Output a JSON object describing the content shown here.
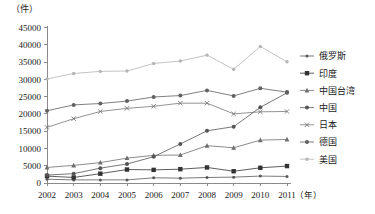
{
  "chart_data": {
    "type": "line",
    "title": "",
    "subtitle": "",
    "unit_label": "（件）",
    "xlabel": "（年）",
    "ylabel": "",
    "grid": false,
    "legend_position": "right",
    "categories": [
      "2002",
      "2003",
      "2004",
      "2005",
      "2006",
      "2007",
      "2008",
      "2009",
      "2010",
      "2011"
    ],
    "x": [
      2002,
      2003,
      2004,
      2005,
      2006,
      2007,
      2008,
      2009,
      2010,
      2011
    ],
    "xlim": [
      2002,
      2011
    ],
    "ylim": [
      0,
      45000
    ],
    "ytick_labels": [
      "0",
      "5000",
      "10000",
      "15000",
      "20000",
      "25000",
      "30000",
      "35000",
      "40000",
      "45000"
    ],
    "ytick_values": [
      0,
      5000,
      10000,
      15000,
      20000,
      25000,
      30000,
      35000,
      40000,
      45000
    ],
    "series": [
      {
        "name": "俄罗斯",
        "marker": "small-dot",
        "color": "#595959",
        "values": [
          1100,
          900,
          900,
          900,
          1500,
          1400,
          1600,
          1700,
          2000,
          1900
        ]
      },
      {
        "name": "印度",
        "marker": "filled-square",
        "color": "#333333",
        "values": [
          2000,
          1600,
          2700,
          3900,
          3800,
          4000,
          4500,
          3400,
          4400,
          4900
        ]
      },
      {
        "name": "中国台湾",
        "marker": "triangle",
        "color": "#6e6e6e",
        "values": [
          4500,
          5100,
          5900,
          7200,
          8000,
          8100,
          10800,
          10200,
          12400,
          12600
        ]
      },
      {
        "name": "中国",
        "marker": "dot",
        "color": "#555555",
        "values": [
          2300,
          2700,
          4300,
          5500,
          7600,
          11300,
          15100,
          16300,
          21900,
          26100
        ]
      },
      {
        "name": "日本",
        "marker": "x-mark",
        "color": "#777777",
        "values": [
          16100,
          18600,
          20700,
          21600,
          22200,
          23100,
          23100,
          20000,
          20600,
          20700
        ]
      },
      {
        "name": "德国",
        "marker": "dot",
        "color": "#606060",
        "values": [
          20900,
          22600,
          23000,
          23700,
          24900,
          25300,
          26800,
          25200,
          27400,
          26300
        ]
      },
      {
        "name": "美国",
        "marker": "light-dot",
        "color": "#b5b5b5",
        "values": [
          30100,
          31700,
          32300,
          32400,
          34600,
          35300,
          37000,
          32900,
          39500,
          35100
        ]
      }
    ]
  }
}
